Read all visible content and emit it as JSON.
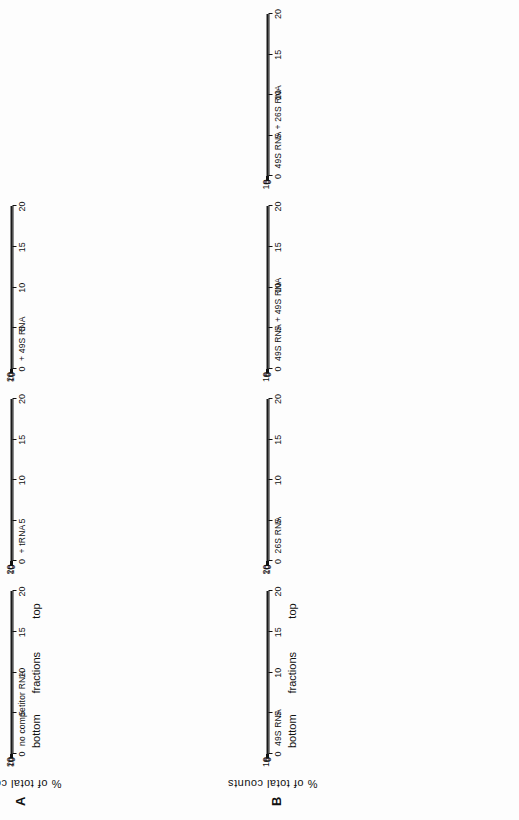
{
  "figure": {
    "axis_y_label": "%  of  total  counts",
    "x_captions": [
      "bottom",
      "fractions",
      "top"
    ],
    "x_ticks": [
      0,
      5,
      10,
      15,
      20
    ],
    "x_range": [
      0,
      20
    ]
  },
  "rows": [
    {
      "letter": "A",
      "ylabel": "%  of  total  counts",
      "panels": [
        {
          "title": "no competitor RNA",
          "y_ticks": [
            0,
            10,
            20
          ],
          "ylim": [
            0,
            21
          ],
          "show_x_captions": true,
          "chart_data": {
            "type": "line",
            "title": "no competitor RNA",
            "xlabel": "fractions",
            "ylabel": "% of total counts",
            "xlim": [
              0,
              20
            ],
            "ylim": [
              0,
              21
            ],
            "series": [
              {
                "name": "counts",
                "marker": "filled-square",
                "x": [
                  0.3,
                  1.0,
                  1.8,
                  2.6,
                  3.4,
                  4.2,
                  5.2,
                  6.3,
                  7.4,
                  8.5,
                  9.5,
                  10.6,
                  11.7,
                  12.8,
                  13.9,
                  15.0,
                  16.1,
                  17.2,
                  18.3,
                  19.3,
                  20.0
                ],
                "y": [
                  2.6,
                  0.9,
                  1.0,
                  1.3,
                  2.1,
                  3.3,
                  4.8,
                  7.0,
                  10.0,
                  14.3,
                  13.6,
                  10.4,
                  8.0,
                  6.3,
                  5.0,
                  4.0,
                  3.1,
                  2.3,
                  1.7,
                  1.4,
                  0.5
                ]
              }
            ]
          }
        },
        {
          "title": "+ tRNA",
          "y_ticks": [
            0,
            10,
            20
          ],
          "ylim": [
            0,
            21
          ],
          "show_x_captions": false,
          "chart_data": {
            "type": "line",
            "title": "+ tRNA",
            "xlabel": "fractions",
            "ylabel": "% of total counts",
            "xlim": [
              0,
              20
            ],
            "ylim": [
              0,
              21
            ],
            "series": [
              {
                "name": "series-1",
                "marker": "filled-square",
                "x": [
                  0.3,
                  1.0,
                  1.8,
                  2.6,
                  3.4,
                  4.2,
                  5.2,
                  6.3,
                  7.4,
                  8.5,
                  9.5,
                  10.6,
                  11.7,
                  12.8,
                  13.9,
                  15.0,
                  16.1,
                  17.2,
                  18.3,
                  19.3,
                  20.0
                ],
                "y": [
                  0.7,
                  0.6,
                  0.8,
                  1.0,
                  1.1,
                  1.3,
                  1.7,
                  2.6,
                  5.5,
                  10.5,
                  8.3,
                  13.6,
                  12.6,
                  9.5,
                  6.9,
                  5.2,
                  4.0,
                  3.2,
                  2.8,
                  2.5,
                  1.6
                ]
              },
              {
                "name": "series-2",
                "marker": "filled-square",
                "x": [
                  0.3,
                  1.0,
                  1.8,
                  2.6,
                  3.4,
                  4.2,
                  5.2,
                  6.3,
                  7.4,
                  8.5,
                  9.5,
                  10.6,
                  11.7,
                  12.8,
                  13.9,
                  15.0,
                  16.1,
                  17.2,
                  18.3,
                  19.3,
                  20.0
                ],
                "y": [
                  1.2,
                  1.0,
                  1.2,
                  1.4,
                  1.5,
                  1.6,
                  2.0,
                  3.0,
                  6.0,
                  11.2,
                  10.6,
                  13.0,
                  11.4,
                  8.6,
                  6.3,
                  4.8,
                  3.7,
                  3.5,
                  3.3,
                  3.0,
                  1.2
                ]
              }
            ]
          }
        },
        {
          "title": "+ 49S RNA",
          "y_ticks": [
            0,
            10,
            20
          ],
          "ylim": [
            0,
            21
          ],
          "show_x_captions": false,
          "chart_data": {
            "type": "line",
            "title": "+ 49S RNA",
            "xlabel": "fractions",
            "ylabel": "% of total counts",
            "xlim": [
              0,
              20
            ],
            "ylim": [
              0,
              21
            ],
            "series": [
              {
                "name": "series-1",
                "marker": "filled-square",
                "x": [
                  0.3,
                  1.0,
                  1.8,
                  2.6,
                  3.4,
                  4.2,
                  5.2,
                  6.3,
                  7.4,
                  8.5,
                  9.5,
                  10.6,
                  11.7,
                  12.8,
                  13.9,
                  15.0,
                  16.1,
                  17.2,
                  18.3,
                  19.3,
                  20.0
                ],
                "y": [
                  0.4,
                  0.6,
                  0.7,
                  0.9,
                  1.0,
                  1.1,
                  1.2,
                  1.6,
                  4.0,
                  10.4,
                  14.2,
                  12.8,
                  8.1,
                  5.3,
                  3.9,
                  3.2,
                  2.8,
                  2.4,
                  2.3,
                  2.0,
                  1.3
                ]
              },
              {
                "name": "series-2",
                "marker": "filled-square",
                "x": [
                  0.3,
                  1.0,
                  1.8,
                  2.6,
                  3.4,
                  4.2,
                  5.2,
                  6.3,
                  7.4,
                  8.5,
                  9.5,
                  10.6,
                  11.7,
                  12.8,
                  13.9,
                  15.0,
                  16.1,
                  17.2,
                  18.3,
                  19.3,
                  20.0
                ],
                "y": [
                  0.5,
                  0.6,
                  0.7,
                  0.8,
                  0.9,
                  1.0,
                  1.1,
                  1.6,
                  2.9,
                  4.6,
                  6.4,
                  8.1,
                  9.8,
                  11.8,
                  12.1,
                  11.4,
                  10.3,
                  11.4,
                  9.0,
                  6.5,
                  2.4
                ]
              }
            ]
          }
        }
      ]
    },
    {
      "letter": "B",
      "ylabel": "%  of  total  counts",
      "panels": [
        {
          "title": "49S RNA",
          "y_ticks": [
            0,
            5,
            10
          ],
          "ylim": [
            0,
            11.5
          ],
          "show_x_captions": true,
          "chart_data": {
            "type": "line",
            "title": "49S RNA",
            "xlabel": "fractions",
            "ylabel": "% of total counts",
            "xlim": [
              0,
              20
            ],
            "ylim": [
              0,
              11.5
            ],
            "series": [
              {
                "name": "counts",
                "marker": "filled-square",
                "x": [
                  0.3,
                  1.0,
                  1.8,
                  2.6,
                  3.4,
                  4.2,
                  5.2,
                  6.3,
                  7.4,
                  8.5,
                  9.5,
                  10.6,
                  11.7,
                  12.8,
                  13.9,
                  15.0,
                  16.1,
                  17.2,
                  18.3,
                  19.3,
                  20.0
                ],
                "y": [
                  0.6,
                  0.7,
                  0.8,
                  0.9,
                  1.0,
                  1.2,
                  1.9,
                  3.2,
                  5.3,
                  7.7,
                  10.9,
                  9.9,
                  8.1,
                  6.9,
                  5.3,
                  4.3,
                  3.4,
                  3.0,
                  3.3,
                  4.4,
                  5.4
                ]
              }
            ]
          }
        },
        {
          "title": "26S RNA",
          "y_ticks": [
            0,
            10,
            20
          ],
          "ylim": [
            0,
            24
          ],
          "show_x_captions": false,
          "chart_data": {
            "type": "line",
            "title": "26S RNA",
            "xlabel": "fractions",
            "ylabel": "% of total counts",
            "xlim": [
              0,
              20
            ],
            "ylim": [
              0,
              24
            ],
            "series": [
              {
                "name": "counts",
                "marker": "filled-square",
                "x": [
                  0.3,
                  1.0,
                  1.8,
                  2.6,
                  3.4,
                  4.2,
                  5.2,
                  6.3,
                  7.4,
                  8.5,
                  9.5,
                  10.6,
                  11.7,
                  12.8,
                  13.9,
                  15.0,
                  16.1,
                  17.2,
                  18.3,
                  19.3,
                  20.0
                ],
                "y": [
                  0.5,
                  0.6,
                  1.3,
                  1.4,
                  1.6,
                  1.8,
                  2.0,
                  2.3,
                  4.0,
                  9.5,
                  23.0,
                  19.0,
                  13.5,
                  9.0,
                  5.2,
                  2.4,
                  1.5,
                  1.8,
                  2.0,
                  2.2,
                  2.6
                ]
              }
            ]
          }
        },
        {
          "title": "49S RNA + 49S RNA",
          "y_ticks": [
            0,
            5,
            10
          ],
          "ylim": [
            0,
            11.5
          ],
          "show_x_captions": false,
          "chart_data": {
            "type": "line",
            "title": "49S RNA + 49S RNA",
            "xlabel": "fractions",
            "ylabel": "% of total counts",
            "xlim": [
              0,
              20
            ],
            "ylim": [
              0,
              11.5
            ],
            "series": [
              {
                "name": "series-1",
                "marker": "filled-square",
                "x": [
                  0.3,
                  1.0,
                  1.8,
                  2.6,
                  3.4,
                  4.2,
                  5.2,
                  6.3,
                  7.4,
                  8.5,
                  9.5,
                  10.6,
                  11.7,
                  12.8,
                  13.9,
                  15.0,
                  16.1,
                  17.2,
                  18.3,
                  19.3,
                  20.0
                ],
                "y": [
                  0.5,
                  0.3,
                  0.4,
                  0.5,
                  0.6,
                  0.7,
                  0.9,
                  1.5,
                  2.8,
                  4.9,
                  7.5,
                  9.4,
                  9.6,
                  8.9,
                  8.0,
                  7.2,
                  6.3,
                  5.9,
                  7.2,
                  8.3,
                  9.4
                ]
              },
              {
                "name": "series-2",
                "marker": "filled-square",
                "x": [
                  0.3,
                  1.0,
                  1.8,
                  2.6,
                  3.4,
                  4.2,
                  5.2,
                  6.3,
                  7.4,
                  8.5,
                  9.5,
                  10.6,
                  11.7,
                  12.8,
                  13.9,
                  15.0,
                  16.1,
                  17.2,
                  18.3,
                  19.3,
                  20.0
                ],
                "y": [
                  0.7,
                  0.5,
                  0.5,
                  0.6,
                  0.7,
                  0.8,
                  1.0,
                  1.6,
                  2.9,
                  5.0,
                  7.6,
                  9.5,
                  9.5,
                  8.7,
                  7.8,
                  7.0,
                  6.1,
                  6.0,
                  7.0,
                  7.0,
                  7.0
                ]
              }
            ]
          }
        },
        {
          "title": "49S RNA + 26S RNA",
          "y_ticks": [
            0,
            5,
            10
          ],
          "ylim": [
            0,
            11.5
          ],
          "show_x_captions": false,
          "chart_data": {
            "type": "line",
            "title": "49S RNA + 26S RNA",
            "xlabel": "fractions",
            "ylabel": "% of total counts",
            "xlim": [
              0,
              20
            ],
            "ylim": [
              0,
              11.5
            ],
            "series": [
              {
                "name": "series-1",
                "marker": "filled-square",
                "x": [
                  0.3,
                  1.0,
                  1.8,
                  2.6,
                  3.4,
                  4.2,
                  5.2,
                  6.3,
                  7.4,
                  8.5,
                  9.5,
                  10.6,
                  11.7,
                  12.8,
                  13.9,
                  15.0,
                  16.1,
                  17.2,
                  18.3,
                  19.3,
                  20.0
                ],
                "y": [
                  0.6,
                  0.5,
                  0.4,
                  0.4,
                  0.5,
                  0.6,
                  0.9,
                  1.5,
                  2.9,
                  5.0,
                  7.4,
                  8.9,
                  9.3,
                  8.9,
                  7.8,
                  6.4,
                  5.0,
                  4.3,
                  5.1,
                  6.6,
                  7.8
                ]
              },
              {
                "name": "series-2",
                "marker": "filled-square",
                "x": [
                  0.3,
                  1.0,
                  1.8,
                  2.6,
                  3.4,
                  4.2,
                  5.2,
                  6.3,
                  7.4,
                  8.5,
                  9.5,
                  10.6,
                  11.7,
                  12.8,
                  13.9,
                  15.0,
                  16.1,
                  17.2,
                  18.3,
                  19.3,
                  20.0
                ],
                "y": [
                  0.5,
                  0.4,
                  0.4,
                  0.4,
                  0.5,
                  0.6,
                  0.8,
                  1.3,
                  2.3,
                  3.9,
                  5.6,
                  6.9,
                  7.6,
                  8.1,
                  8.5,
                  9.2,
                  8.2,
                  7.1,
                  6.0,
                  6.8,
                  7.8
                ]
              }
            ]
          }
        }
      ]
    }
  ]
}
